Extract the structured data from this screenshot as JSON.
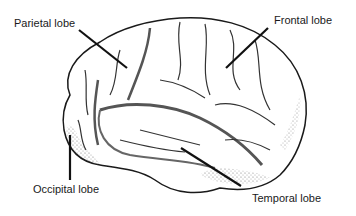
{
  "diagram": {
    "labels": [
      {
        "id": "parietal",
        "text": "Parietal lobe",
        "x": 14,
        "y": 18
      },
      {
        "id": "frontal",
        "text": "Frontal lobe",
        "x": 274,
        "y": 15
      },
      {
        "id": "occipital",
        "text": "Occipital lobe",
        "x": 33,
        "y": 184
      },
      {
        "id": "temporal",
        "text": "Temporal lobe",
        "x": 252,
        "y": 193
      }
    ],
    "colors": {
      "outline": "#1a1a1a",
      "fill": "#ffffff",
      "shade": "#9a9a9a",
      "text": "#1a1a1a"
    }
  }
}
